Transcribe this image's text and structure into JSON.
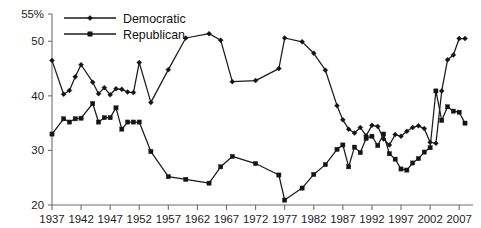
{
  "chart_data": {
    "type": "line",
    "title": "",
    "subtitle": "",
    "xlabel": "",
    "ylabel": "",
    "grid": false,
    "legend_position": "top-left",
    "ylim": [
      20,
      55
    ],
    "xlim": [
      1937,
      2008
    ],
    "ytick_labels": [
      "55%",
      "50",
      "40",
      "30",
      "20"
    ],
    "ytick_values": [
      55,
      50,
      40,
      30,
      20
    ],
    "xtick_labels": [
      "1937",
      "1942",
      "1947",
      "1952",
      "1957",
      "1962",
      "1967",
      "1972",
      "1977",
      "1982",
      "1987",
      "1992",
      "1997",
      "2002",
      "2007"
    ],
    "xtick_values": [
      1937,
      1942,
      1947,
      1952,
      1957,
      1962,
      1967,
      1972,
      1977,
      1982,
      1987,
      1992,
      1997,
      2002,
      2007
    ],
    "series": [
      {
        "name": "Democratic",
        "marker": "diamond",
        "color": "#1a1a1a",
        "x": [
          1937,
          1939,
          1940,
          1941,
          1942,
          1944,
          1945,
          1946,
          1947,
          1948,
          1949,
          1950,
          1951,
          1952,
          1954,
          1957,
          1960,
          1964,
          1966,
          1968,
          1972,
          1976,
          1977,
          1980,
          1982,
          1984,
          1986,
          1987,
          1988,
          1989,
          1990,
          1991,
          1992,
          1993,
          1994,
          1995,
          1996,
          1997,
          1998,
          1999,
          2000,
          2001,
          2002,
          2003,
          2004,
          2005,
          2006,
          2007,
          2008
        ],
        "y": [
          46.5,
          40.3,
          41.0,
          43.5,
          45.7,
          42.5,
          40.4,
          41.5,
          40.2,
          41.3,
          41.2,
          40.7,
          40.6,
          46.1,
          38.8,
          44.8,
          50.6,
          51.4,
          50.2,
          42.6,
          42.8,
          45.0,
          50.6,
          49.9,
          47.8,
          44.7,
          38.2,
          35.6,
          33.9,
          33.2,
          34.2,
          32.7,
          34.6,
          34.4,
          32.1,
          31.0,
          32.9,
          32.6,
          33.5,
          34.2,
          34.5,
          34.0,
          31.5,
          31.3,
          40.9,
          46.6,
          47.5,
          50.5,
          50.5
        ]
      },
      {
        "name": "Republican",
        "marker": "square",
        "color": "#1a1a1a",
        "x": [
          1937,
          1939,
          1940,
          1941,
          1942,
          1944,
          1945,
          1946,
          1947,
          1948,
          1949,
          1950,
          1951,
          1952,
          1954,
          1957,
          1960,
          1964,
          1966,
          1968,
          1972,
          1976,
          1977,
          1980,
          1982,
          1984,
          1986,
          1987,
          1988,
          1989,
          1990,
          1991,
          1992,
          1993,
          1994,
          1995,
          1996,
          1997,
          1998,
          1999,
          2000,
          2001,
          2002,
          2003,
          2004,
          2005,
          2006,
          2007,
          2008
        ],
        "y": [
          33.0,
          35.8,
          35.2,
          35.8,
          35.9,
          38.6,
          35.2,
          36.0,
          36.0,
          37.8,
          33.9,
          35.2,
          35.2,
          35.2,
          29.8,
          25.2,
          24.7,
          24.0,
          27.0,
          28.9,
          27.6,
          25.5,
          20.9,
          23.1,
          25.6,
          27.4,
          30.2,
          31.0,
          27.0,
          30.6,
          29.6,
          32.2,
          32.6,
          30.9,
          33.0,
          29.4,
          28.4,
          26.6,
          26.4,
          27.7,
          28.5,
          29.7,
          30.5,
          40.9,
          35.5,
          38.0,
          37.2,
          37.0,
          35.0
        ]
      }
    ]
  }
}
